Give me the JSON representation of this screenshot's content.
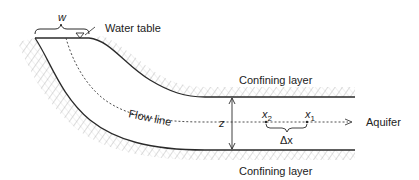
{
  "diagram": {
    "labels": {
      "w": "w",
      "water_table": "Water table",
      "confining_layer_top": "Confining layer",
      "confining_layer_bottom": "Confining layer",
      "flow_line": "Flow line",
      "z": "z",
      "x2": "x",
      "x2_sub": "2",
      "x1": "x",
      "x1_sub": "1",
      "delta_x": "Δx",
      "aquifer": "Aquifer"
    },
    "colors": {
      "line": "#2a2a2a",
      "hatch": "#9a9a9a",
      "text": "#222222",
      "background": "#ffffff"
    }
  }
}
